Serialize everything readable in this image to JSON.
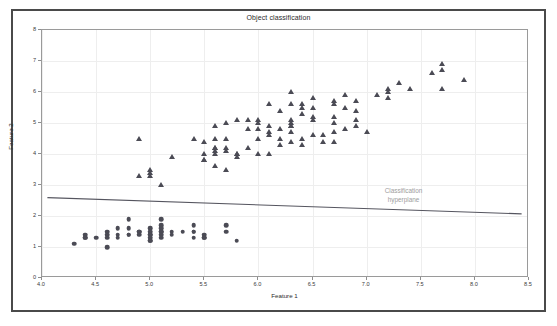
{
  "window": {
    "frame_color": "#4a4a4a",
    "background": "#ffffff"
  },
  "chart_data": {
    "type": "scatter",
    "title": "Object classification",
    "xlabel": "Feature 1",
    "ylabel": "Feature 2",
    "xlim": [
      4.0,
      8.5
    ],
    "ylim": [
      0,
      8
    ],
    "xticks": [
      "4.0",
      "4.5",
      "5.0",
      "5.5",
      "6.0",
      "6.5",
      "7.0",
      "7.5",
      "8.0",
      "8.5"
    ],
    "xtick_values": [
      4.0,
      4.5,
      5.0,
      5.5,
      6.0,
      6.5,
      7.0,
      7.5,
      8.0,
      8.5
    ],
    "yticks": [
      "0",
      "1",
      "2",
      "3",
      "4",
      "5",
      "6",
      "7",
      "8"
    ],
    "ytick_values": [
      0,
      1,
      2,
      3,
      4,
      5,
      6,
      7,
      8
    ],
    "grid": true,
    "legend": null,
    "marker_color": "#4b4b55",
    "series": [
      {
        "name": "class-circles",
        "marker": "circle",
        "points": [
          [
            4.3,
            1.1
          ],
          [
            4.4,
            1.3
          ],
          [
            4.4,
            1.4
          ],
          [
            4.4,
            1.3
          ],
          [
            4.5,
            1.3
          ],
          [
            4.6,
            1.4
          ],
          [
            4.6,
            1.5
          ],
          [
            4.6,
            1.3
          ],
          [
            4.6,
            1.0
          ],
          [
            4.7,
            1.6
          ],
          [
            4.7,
            1.4
          ],
          [
            4.7,
            1.3
          ],
          [
            4.8,
            1.9
          ],
          [
            4.8,
            1.6
          ],
          [
            4.8,
            1.4
          ],
          [
            4.8,
            1.4
          ],
          [
            4.9,
            1.5
          ],
          [
            4.9,
            1.5
          ],
          [
            4.9,
            1.4
          ],
          [
            5.0,
            1.6
          ],
          [
            5.0,
            1.5
          ],
          [
            5.0,
            1.4
          ],
          [
            5.0,
            1.4
          ],
          [
            5.0,
            1.3
          ],
          [
            5.0,
            1.2
          ],
          [
            5.0,
            1.2
          ],
          [
            5.1,
            1.9
          ],
          [
            5.1,
            1.7
          ],
          [
            5.1,
            1.6
          ],
          [
            5.1,
            1.5
          ],
          [
            5.1,
            1.5
          ],
          [
            5.1,
            1.4
          ],
          [
            5.1,
            1.3
          ],
          [
            5.2,
            1.5
          ],
          [
            5.2,
            1.4
          ],
          [
            5.3,
            1.5
          ],
          [
            5.4,
            1.7
          ],
          [
            5.4,
            1.5
          ],
          [
            5.4,
            1.5
          ],
          [
            5.4,
            1.3
          ],
          [
            5.5,
            1.4
          ],
          [
            5.5,
            1.3
          ],
          [
            5.5,
            1.3
          ],
          [
            5.7,
            1.7
          ],
          [
            5.7,
            1.5
          ],
          [
            5.8,
            1.2
          ]
        ]
      },
      {
        "name": "class-triangles",
        "marker": "triangle",
        "points": [
          [
            4.9,
            4.5
          ],
          [
            4.9,
            3.3
          ],
          [
            5.0,
            3.5
          ],
          [
            5.0,
            3.4
          ],
          [
            5.0,
            3.3
          ],
          [
            5.1,
            3.0
          ],
          [
            5.2,
            3.9
          ],
          [
            5.4,
            4.5
          ],
          [
            5.5,
            4.4
          ],
          [
            5.5,
            4.0
          ],
          [
            5.5,
            3.8
          ],
          [
            5.5,
            3.8
          ],
          [
            5.6,
            4.9
          ],
          [
            5.6,
            4.5
          ],
          [
            5.6,
            4.2
          ],
          [
            5.6,
            4.2
          ],
          [
            5.6,
            4.1
          ],
          [
            5.6,
            4.0
          ],
          [
            5.6,
            3.6
          ],
          [
            5.7,
            5.0
          ],
          [
            5.7,
            4.5
          ],
          [
            5.7,
            4.2
          ],
          [
            5.7,
            4.1
          ],
          [
            5.7,
            3.5
          ],
          [
            5.8,
            5.1
          ],
          [
            5.8,
            4.0
          ],
          [
            5.8,
            4.0
          ],
          [
            5.8,
            3.9
          ],
          [
            5.9,
            5.1
          ],
          [
            5.9,
            4.8
          ],
          [
            5.9,
            4.2
          ],
          [
            6.0,
            5.1
          ],
          [
            6.0,
            5.0
          ],
          [
            6.0,
            4.8
          ],
          [
            6.0,
            4.5
          ],
          [
            6.0,
            4.0
          ],
          [
            6.1,
            5.6
          ],
          [
            6.1,
            4.9
          ],
          [
            6.1,
            4.7
          ],
          [
            6.1,
            4.6
          ],
          [
            6.1,
            4.0
          ],
          [
            6.2,
            5.4
          ],
          [
            6.2,
            4.8
          ],
          [
            6.2,
            4.5
          ],
          [
            6.2,
            4.3
          ],
          [
            6.3,
            6.0
          ],
          [
            6.3,
            5.6
          ],
          [
            6.3,
            5.1
          ],
          [
            6.3,
            5.0
          ],
          [
            6.3,
            4.9
          ],
          [
            6.3,
            4.9
          ],
          [
            6.3,
            4.7
          ],
          [
            6.3,
            4.4
          ],
          [
            6.4,
            5.6
          ],
          [
            6.4,
            5.5
          ],
          [
            6.4,
            5.3
          ],
          [
            6.4,
            4.5
          ],
          [
            6.4,
            4.3
          ],
          [
            6.5,
            5.8
          ],
          [
            6.5,
            5.5
          ],
          [
            6.5,
            5.2
          ],
          [
            6.5,
            5.1
          ],
          [
            6.5,
            4.6
          ],
          [
            6.6,
            4.6
          ],
          [
            6.6,
            4.4
          ],
          [
            6.7,
            5.7
          ],
          [
            6.7,
            5.6
          ],
          [
            6.7,
            5.2
          ],
          [
            6.7,
            5.0
          ],
          [
            6.7,
            4.7
          ],
          [
            6.7,
            4.4
          ],
          [
            6.8,
            5.9
          ],
          [
            6.8,
            5.5
          ],
          [
            6.8,
            4.8
          ],
          [
            6.9,
            5.7
          ],
          [
            6.9,
            5.4
          ],
          [
            6.9,
            5.1
          ],
          [
            6.9,
            4.9
          ],
          [
            7.0,
            4.7
          ],
          [
            7.1,
            5.9
          ],
          [
            7.2,
            6.1
          ],
          [
            7.2,
            6.0
          ],
          [
            7.2,
            5.8
          ],
          [
            7.3,
            6.3
          ],
          [
            7.4,
            6.1
          ],
          [
            7.6,
            6.6
          ],
          [
            7.7,
            6.9
          ],
          [
            7.7,
            6.7
          ],
          [
            7.7,
            6.1
          ],
          [
            7.9,
            6.4
          ]
        ]
      }
    ],
    "hyperplane": {
      "label_line_1": "Classification",
      "label_line_2": "hyperplane",
      "label_color": "#9d9d9d",
      "line_color": "#55555f",
      "x_start": 4.05,
      "y_start": 2.55,
      "x_end": 8.45,
      "y_end": 2.02
    }
  }
}
